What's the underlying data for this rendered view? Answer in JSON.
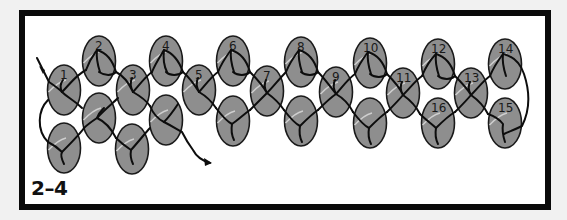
{
  "figure": {
    "label": "2–4"
  },
  "colors": {
    "page_background": "#f1f1f1",
    "frame": "#0a0a0a",
    "panel": "#ffffff",
    "bead_fill": "#8e8e8e",
    "bead_stroke": "#1a1a1a",
    "bead_highlight": "#cfcfcf",
    "thread": "#0d0d0d"
  },
  "beads": [
    {
      "id": "1",
      "label": "1",
      "cx": 64,
      "cy": 90
    },
    {
      "id": "2",
      "label": "2",
      "cx": 99,
      "cy": 61
    },
    {
      "id": "3",
      "label": "3",
      "cx": 133,
      "cy": 90
    },
    {
      "id": "4",
      "label": "4",
      "cx": 166,
      "cy": 61
    },
    {
      "id": "5",
      "label": "5",
      "cx": 199,
      "cy": 90
    },
    {
      "id": "6",
      "label": "6",
      "cx": 233,
      "cy": 61
    },
    {
      "id": "7",
      "label": "7",
      "cx": 267,
      "cy": 91
    },
    {
      "id": "8",
      "label": "8",
      "cx": 301,
      "cy": 62
    },
    {
      "id": "9",
      "label": "9",
      "cx": 336,
      "cy": 92
    },
    {
      "id": "10",
      "label": "10",
      "cx": 370,
      "cy": 63
    },
    {
      "id": "11",
      "label": "11",
      "cx": 403,
      "cy": 93
    },
    {
      "id": "12",
      "label": "12",
      "cx": 438,
      "cy": 64
    },
    {
      "id": "13",
      "label": "13",
      "cx": 471,
      "cy": 93
    },
    {
      "id": "14",
      "label": "14",
      "cx": 505,
      "cy": 64
    },
    {
      "id": "15",
      "label": "15",
      "cx": 505,
      "cy": 123
    },
    {
      "id": "16",
      "label": "16",
      "cx": 438,
      "cy": 123
    },
    {
      "id": "b1",
      "label": "",
      "cx": 64,
      "cy": 148
    },
    {
      "id": "b2",
      "label": "",
      "cx": 99,
      "cy": 118
    },
    {
      "id": "b3",
      "label": "",
      "cx": 132,
      "cy": 149
    },
    {
      "id": "b4",
      "label": "",
      "cx": 166,
      "cy": 120
    },
    {
      "id": "b6",
      "label": "",
      "cx": 233,
      "cy": 121
    },
    {
      "id": "b8",
      "label": "",
      "cx": 301,
      "cy": 121
    },
    {
      "id": "b10",
      "label": "",
      "cx": 370,
      "cy": 123
    }
  ],
  "bead_size": {
    "rx": 16.5,
    "ry": 25
  }
}
